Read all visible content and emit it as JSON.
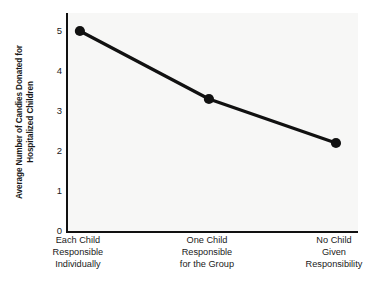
{
  "chart_data": {
    "type": "line",
    "title": "",
    "xlabel": "",
    "ylabel": "Average Number of Candies Donated for Hospitalized Children",
    "ylabel_lines": [
      "Average Number of Candies Donated for",
      "Hospitalized Children"
    ],
    "categories": [
      "Each Child Responsible Individually",
      "One Child Responsible for the Group",
      "No Child Given Responsibility"
    ],
    "category_lines": [
      [
        "Each Child",
        "Responsible",
        "Individually"
      ],
      [
        "One Child",
        "Responsible",
        "for the Group"
      ],
      [
        "No Child",
        "Given",
        "Responsibility"
      ]
    ],
    "values": [
      5.0,
      3.3,
      2.2
    ],
    "ylim": [
      0,
      5.45
    ],
    "yticks": [
      0,
      1,
      2,
      3,
      4,
      5
    ],
    "ytick_labels": [
      "0",
      "1",
      "2",
      "3",
      "4",
      "5"
    ],
    "grid": false,
    "legend": "none",
    "marker": "filled-circle",
    "line_color": "#111111",
    "marker_color": "#111111",
    "plot_background": "#f7f7f6",
    "figure_background": "#ffffff",
    "axis_color": "#111111"
  }
}
